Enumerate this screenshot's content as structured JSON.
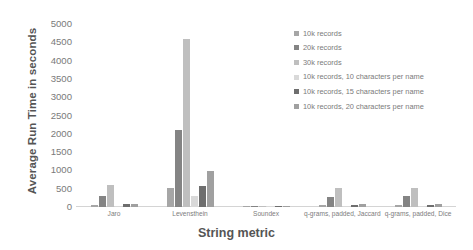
{
  "chart_data": {
    "type": "bar",
    "title": "",
    "xlabel": "String metric",
    "ylabel": "Average Run Time in seconds",
    "ylim": [
      0,
      5000
    ],
    "ytick_step": 500,
    "yticks": [
      "5000",
      "4500",
      "4000",
      "3500",
      "3000",
      "2500",
      "2000",
      "1500",
      "1000",
      "500",
      "0"
    ],
    "grid": false,
    "legend_position": "upper right",
    "categories": [
      "Jaro",
      "Levensthein",
      "Soundex",
      "q-grams, padded, Jaccard",
      "q-grams, padded, Dice"
    ],
    "series": [
      {
        "name": "10k records",
        "color": "#a6a6a6",
        "values": [
          55,
          510,
          5,
          60,
          60
        ]
      },
      {
        "name": "20k records",
        "color": "#848484",
        "values": [
          290,
          2100,
          12,
          280,
          290
        ]
      },
      {
        "name": "30k records",
        "color": "#bfbfbf",
        "values": [
          610,
          4600,
          20,
          520,
          530
        ]
      },
      {
        "name": "10k records, 10 characters per name",
        "color": "#d9d9d9",
        "values": [
          40,
          310,
          4,
          35,
          35
        ]
      },
      {
        "name": "10k records, 15 characters per name",
        "color": "#6e6e6e",
        "values": [
          70,
          570,
          6,
          60,
          65
        ]
      },
      {
        "name": "10k records, 20 characters per name",
        "color": "#a0a0a0",
        "values": [
          85,
          980,
          8,
          80,
          85
        ]
      }
    ]
  },
  "axes": {
    "y_title": "Average Run Time in seconds",
    "x_title": "String metric"
  }
}
